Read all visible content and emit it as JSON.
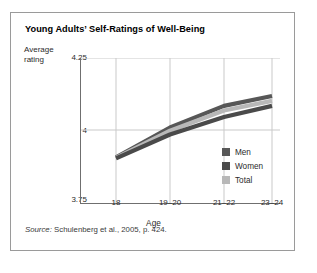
{
  "figure": {
    "title": "Young Adults’ Self-Ratings of Well-Being",
    "source_prefix": "Source:",
    "source_text": " Schulenberg et al., 2005, p. 424."
  },
  "axes": {
    "ylabel_line1": "Average",
    "ylabel_line2": "rating",
    "ytick_top": "4.25",
    "ytick_mid": "4",
    "ytick_bottom": "3.75",
    "xlabel": "Age"
  },
  "legend": {
    "items": [
      {
        "label": "Men",
        "color": "#575757"
      },
      {
        "label": "Women",
        "color": "#4a4a4a"
      },
      {
        "label": "Total",
        "color": "#b8b8b8"
      }
    ]
  },
  "chart_data": {
    "type": "line",
    "title": "Young Adults’ Self-Ratings of Well-Being",
    "xlabel": "Age",
    "ylabel": "Average rating",
    "categories": [
      "18",
      "19–20",
      "21–22",
      "23–24"
    ],
    "ylim": [
      3.75,
      4.25
    ],
    "yticks": [
      3.75,
      4.0,
      4.25
    ],
    "ytick_labels": [
      "3.75",
      "4",
      "4.25"
    ],
    "grid": "horizontal-and-vertical",
    "legend_position": "inside-lower-right",
    "series": [
      {
        "name": "Men",
        "color": "#575757",
        "values": [
          3.91,
          4.012,
          4.086,
          4.12
        ]
      },
      {
        "name": "Total",
        "color": "#b8b8b8",
        "values": [
          3.908,
          4.001,
          4.07,
          4.103
        ]
      },
      {
        "name": "Women",
        "color": "#4a4a4a",
        "values": [
          3.906,
          3.988,
          4.048,
          4.086
        ]
      }
    ],
    "annotations": [
      "Source: Schulenberg et al., 2005, p. 424."
    ]
  }
}
